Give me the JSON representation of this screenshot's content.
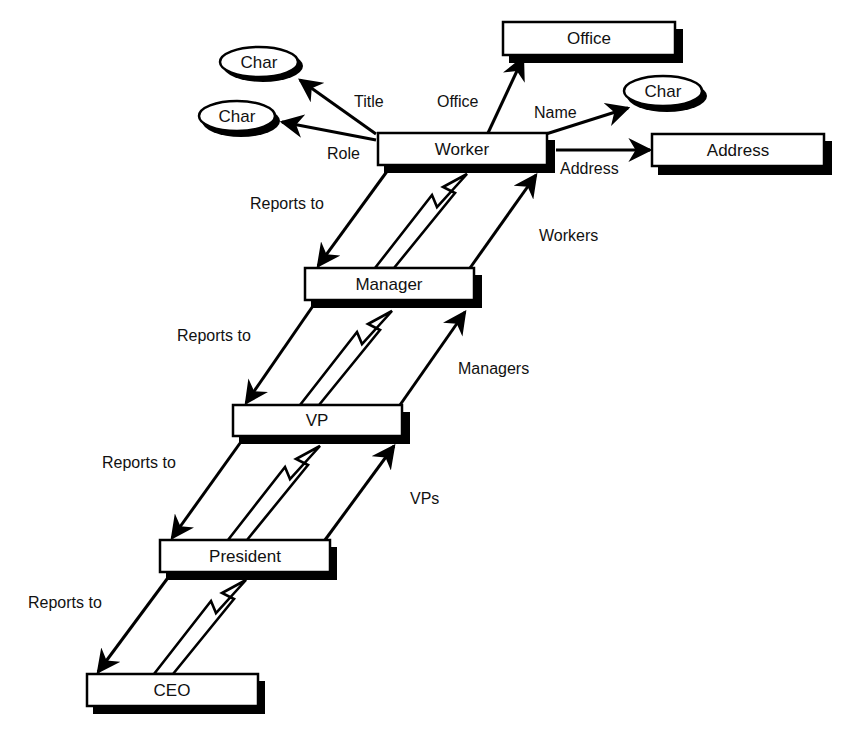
{
  "diagram": {
    "type": "class-hierarchy",
    "nodes": {
      "worker": {
        "label": "Worker",
        "shape": "box"
      },
      "manager": {
        "label": "Manager",
        "shape": "box"
      },
      "vp": {
        "label": "VP",
        "shape": "box"
      },
      "president": {
        "label": "President",
        "shape": "box"
      },
      "ceo": {
        "label": "CEO",
        "shape": "box"
      },
      "office": {
        "label": "Office",
        "shape": "box"
      },
      "address": {
        "label": "Address",
        "shape": "box"
      },
      "char_title": {
        "label": "Char",
        "shape": "ellipse"
      },
      "char_role": {
        "label": "Char",
        "shape": "ellipse"
      },
      "char_name": {
        "label": "Char",
        "shape": "ellipse"
      }
    },
    "edges": {
      "title": {
        "label": "Title",
        "from": "Worker",
        "to": "Char"
      },
      "role": {
        "label": "Role",
        "from": "Worker",
        "to": "Char"
      },
      "office": {
        "label": "Office",
        "from": "Worker",
        "to": "Office"
      },
      "name": {
        "label": "Name",
        "from": "Worker",
        "to": "Char"
      },
      "address": {
        "label": "Address",
        "from": "Worker",
        "to": "Address"
      },
      "manager_reports_to": {
        "label": "Reports to",
        "from": "Worker",
        "to": "Manager"
      },
      "workers": {
        "label": "Workers",
        "from": "Manager",
        "to": "Worker"
      },
      "vp_reports_to": {
        "label": "Reports to",
        "from": "Manager",
        "to": "VP"
      },
      "managers": {
        "label": "Managers",
        "from": "VP",
        "to": "Manager"
      },
      "president_reports_to": {
        "label": "Reports to",
        "from": "VP",
        "to": "President"
      },
      "vps": {
        "label": "VPs",
        "from": "President",
        "to": "VP"
      },
      "ceo_reports_to": {
        "label": "Reports to",
        "from": "President",
        "to": "CEO"
      }
    },
    "inheritance": [
      {
        "from": "Manager",
        "to": "Worker"
      },
      {
        "from": "VP",
        "to": "Manager"
      },
      {
        "from": "President",
        "to": "VP"
      },
      {
        "from": "CEO",
        "to": "President"
      }
    ]
  }
}
